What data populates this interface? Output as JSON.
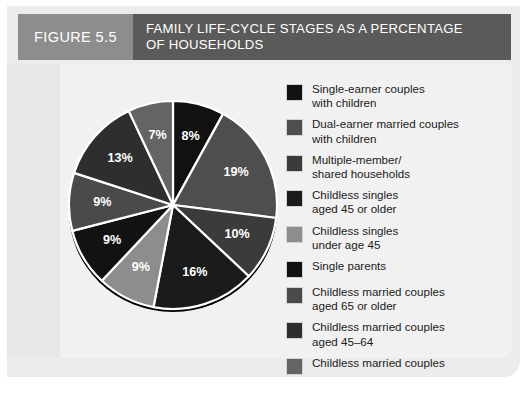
{
  "figure": {
    "tab_label": "FIGURE 5.5",
    "title": "FAMILY LIFE-CYCLE STAGES AS A PERCENTAGE OF HOUSEHOLDS"
  },
  "colors": {
    "tab_bg": "#8d8d8d",
    "title_bg": "#5a5a5a",
    "panel_bg": "#ececec",
    "field_bg": "#f1f1f1",
    "slice_separator": "#ffffff",
    "label_text": "#ffffff"
  },
  "chart_data": {
    "type": "pie",
    "title": "FAMILY LIFE-CYCLE STAGES AS A PERCENTAGE OF HOUSEHOLDS",
    "unit": "%",
    "start_angle_deg": 0,
    "direction": "clockwise",
    "legend_position": "right",
    "categories": [
      "Single-earner couples with children",
      "Dual-earner married couples with children",
      "Multiple-member/ shared households",
      "Childless singles aged 45 or older",
      "Childless singles under age 45",
      "Single parents",
      "Childless married couples aged 65 or older",
      "Childless married couples aged 45-64",
      "Childless married couples"
    ],
    "values": [
      8,
      19,
      10,
      16,
      9,
      9,
      9,
      13,
      7
    ],
    "labels": [
      "8%",
      "19%",
      "10%",
      "16%",
      "9%",
      "9%",
      "9%",
      "13%",
      "7%"
    ],
    "colors": [
      "#111111",
      "#4e4e4e",
      "#3b3b3b",
      "#1b1b1b",
      "#8d8d8d",
      "#121212",
      "#4a4a4a",
      "#2e2e2e",
      "#646464"
    ]
  },
  "legend": {
    "items": [
      {
        "label": "Single-earner couples\nwith children",
        "color": "#111111",
        "value": "8%"
      },
      {
        "label": "Dual-earner married couples\nwith children",
        "color": "#4e4e4e",
        "value": "19%"
      },
      {
        "label": "Multiple-member/\nshared households",
        "color": "#3b3b3b",
        "value": "10%"
      },
      {
        "label": "Childless singles\naged 45 or older",
        "color": "#1b1b1b",
        "value": "16%"
      },
      {
        "label": "Childless singles\nunder age 45",
        "color": "#8d8d8d",
        "value": "9%"
      },
      {
        "label": "Single parents",
        "color": "#121212",
        "value": "9%"
      },
      {
        "label": "Childless married couples\naged 65 or older",
        "color": "#4a4a4a",
        "value": "9%"
      },
      {
        "label": "Childless married couples\naged 45–64",
        "color": "#2e2e2e",
        "value": "13%"
      },
      {
        "label": "Childless married couples",
        "color": "#646464",
        "value": "7%"
      }
    ]
  }
}
